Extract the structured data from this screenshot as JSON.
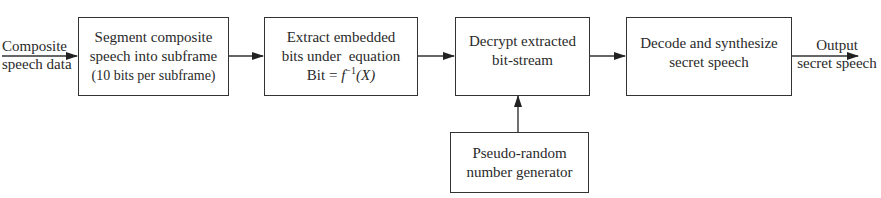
{
  "diagram": {
    "input_label": [
      "Composite",
      "speech data"
    ],
    "output_label": [
      "Output",
      "secret speech"
    ],
    "blocks": [
      {
        "id": "segment",
        "lines": [
          "Segment composite",
          "speech into subframe",
          "(10 bits per subframe)"
        ]
      },
      {
        "id": "extract",
        "lines": [
          "Extract embedded",
          "bits under  equation"
        ],
        "equation": {
          "prefix": "Bit = ",
          "func": "f",
          "sup": "−1",
          "arg": "(X)"
        }
      },
      {
        "id": "decrypt",
        "lines": [
          "Decrypt extracted",
          "bit-stream"
        ]
      },
      {
        "id": "decode",
        "lines": [
          "Decode and synthesize",
          "secret speech"
        ]
      },
      {
        "id": "prng",
        "lines": [
          "Pseudo-random",
          "number generator"
        ]
      }
    ],
    "edges": [
      {
        "from": "input",
        "to": "segment"
      },
      {
        "from": "segment",
        "to": "extract"
      },
      {
        "from": "extract",
        "to": "decrypt"
      },
      {
        "from": "decrypt",
        "to": "decode"
      },
      {
        "from": "decode",
        "to": "output"
      },
      {
        "from": "prng",
        "to": "decrypt"
      }
    ],
    "colors": {
      "line": "#333333",
      "text": "#2a2a2a",
      "background": "#ffffff"
    }
  }
}
